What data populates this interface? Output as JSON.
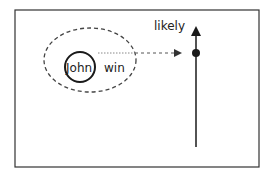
{
  "diagram": {
    "labels": {
      "axis_label": "likely",
      "entity": "John",
      "predicate": "win"
    },
    "colors": {
      "stroke": "#1a1a1a",
      "dashed": "#444444",
      "dotted": "#777777",
      "border": "#333333"
    }
  }
}
